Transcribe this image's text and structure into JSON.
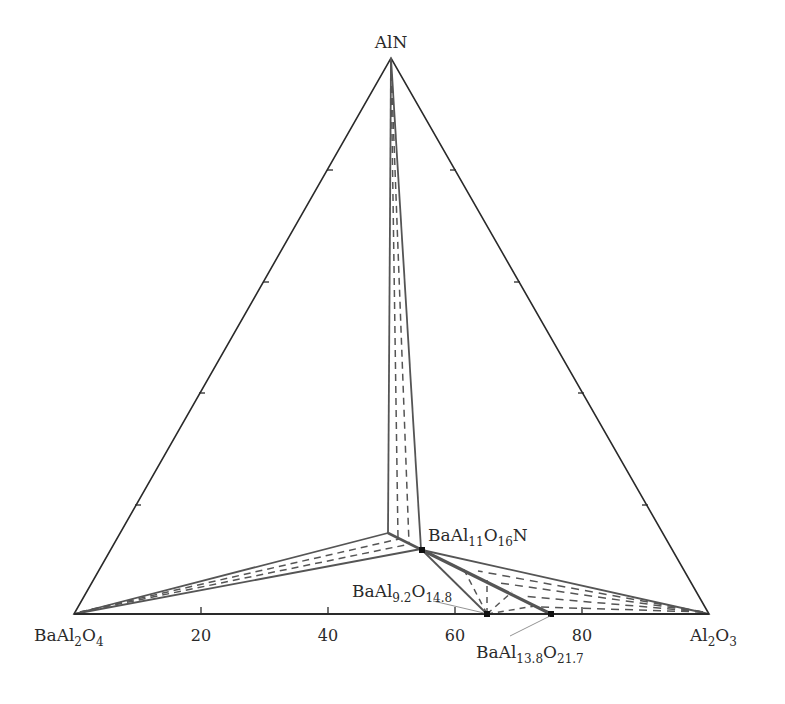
{
  "diagram": {
    "type": "ternary_phase_diagram",
    "vertices": {
      "top": {
        "formula": "AlN",
        "main": "AlN"
      },
      "left": {
        "formula": "BaAl2O4",
        "parts": [
          "BaAl",
          "2",
          "O",
          "4"
        ]
      },
      "right": {
        "formula": "Al2O3",
        "parts": [
          "Al",
          "2",
          "O",
          "3"
        ]
      }
    },
    "bottom_axis_ticks": [
      "20",
      "40",
      "60",
      "80"
    ],
    "phases": [
      {
        "formula": "BaAl11O16N",
        "parts": [
          "BaAl",
          "11",
          "O",
          "16",
          "N"
        ]
      },
      {
        "formula": "BaAl9.2O14.8",
        "parts": [
          "BaAl",
          "9.2",
          "O",
          "14.8"
        ],
        "position_on_bottom_axis": 65
      },
      {
        "formula": "BaAl13.8O21.7",
        "parts": [
          "BaAl",
          "13.8",
          "O",
          "21.7"
        ],
        "position_on_bottom_axis": 75
      }
    ],
    "colors": {
      "outline": "#2a2a2a",
      "tie_lines": "#555555",
      "dashed": "#555555",
      "point": "#111111"
    }
  }
}
